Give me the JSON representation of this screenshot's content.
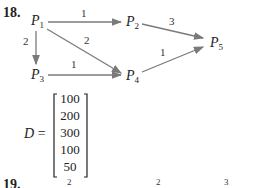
{
  "problem_18": {
    "number": "18.",
    "nodes": [
      {
        "id": "P1",
        "label": "P",
        "sub": "1"
      },
      {
        "id": "P2",
        "label": "P",
        "sub": "2"
      },
      {
        "id": "P3",
        "label": "P",
        "sub": "3"
      },
      {
        "id": "P4",
        "label": "P",
        "sub": "4"
      },
      {
        "id": "P5",
        "label": "P",
        "sub": "5"
      }
    ],
    "edges": [
      {
        "from": "P1",
        "to": "P2",
        "weight": "1"
      },
      {
        "from": "P1",
        "to": "P3",
        "weight": "2"
      },
      {
        "from": "P1",
        "to": "P4",
        "weight": "2"
      },
      {
        "from": "P3",
        "to": "P4",
        "weight": "1"
      },
      {
        "from": "P2",
        "to": "P5",
        "weight": "3"
      },
      {
        "from": "P4",
        "to": "P5",
        "weight": "1"
      }
    ],
    "matrix": {
      "label": "D",
      "equals": "=",
      "values": [
        "100",
        "200",
        "300",
        "100",
        "50"
      ]
    },
    "edge_color": "#7a7a7a"
  },
  "problem_19": {
    "number": "19.",
    "partial_weights": [
      "2",
      "2",
      "3"
    ]
  }
}
